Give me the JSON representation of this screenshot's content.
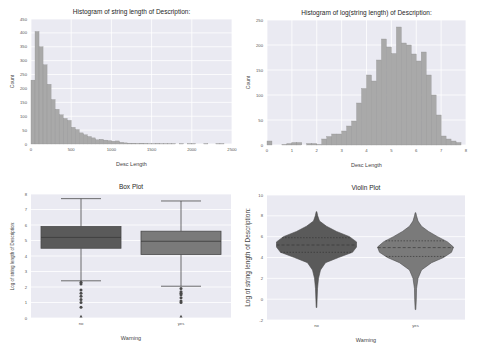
{
  "chart_data": [
    {
      "type": "bar",
      "title": "Histogram of string length of Description:",
      "xlabel": "Desc Length",
      "ylabel": "Count",
      "xlim": [
        0,
        2500
      ],
      "ylim": [
        0,
        450
      ],
      "xticks": [
        "0",
        "500",
        "1000",
        "1500",
        "2000",
        "2500"
      ],
      "yticks": [
        "0",
        "50",
        "100",
        "150",
        "200",
        "250",
        "300",
        "350",
        "400",
        "450"
      ],
      "grid": true,
      "bin_width": 50,
      "bin_starts": [
        0,
        50,
        100,
        150,
        200,
        250,
        300,
        350,
        400,
        450,
        500,
        550,
        600,
        650,
        700,
        750,
        800,
        850,
        900,
        950,
        1000,
        1050,
        1100,
        1150,
        1200,
        1250,
        1300,
        1350,
        1400,
        1450,
        1500,
        1550,
        1600,
        1650,
        1700,
        1750,
        1800,
        1850,
        1900,
        1950,
        2000,
        2050,
        2100,
        2150,
        2200,
        2250,
        2300,
        2350
      ],
      "values": [
        230,
        405,
        350,
        285,
        215,
        160,
        125,
        105,
        92,
        85,
        60,
        52,
        40,
        33,
        27,
        22,
        15,
        17,
        14,
        12,
        10,
        11,
        6,
        4,
        3,
        3,
        2,
        3,
        2,
        1,
        1,
        2,
        1,
        1,
        1,
        1,
        0,
        1,
        0,
        1,
        1,
        0,
        0,
        1,
        0,
        0,
        1,
        1
      ]
    },
    {
      "type": "bar",
      "title": "Histogram of log(string length) of Description:",
      "xlabel": "Desc Length",
      "ylabel": "Count",
      "xlim": [
        0,
        8
      ],
      "ylim": [
        0,
        250
      ],
      "xticks": [
        "0",
        "1",
        "2",
        "3",
        "4",
        "5",
        "6",
        "7",
        "8"
      ],
      "yticks": [
        "0",
        "50",
        "100",
        "150",
        "200",
        "250"
      ],
      "grid": true,
      "bin_width": 0.2,
      "bin_starts": [
        0.0,
        0.2,
        0.4,
        0.6,
        0.8,
        1.0,
        1.2,
        1.4,
        1.6,
        1.8,
        2.0,
        2.2,
        2.4,
        2.6,
        2.8,
        3.0,
        3.2,
        3.4,
        3.6,
        3.8,
        4.0,
        4.2,
        4.4,
        4.6,
        4.8,
        5.0,
        5.2,
        5.4,
        5.6,
        5.8,
        6.0,
        6.2,
        6.4,
        6.6,
        6.8,
        7.0,
        7.2,
        7.4,
        7.6
      ],
      "values": [
        8,
        0,
        0,
        1,
        3,
        5,
        5,
        0,
        3,
        3,
        1,
        12,
        17,
        22,
        22,
        28,
        38,
        48,
        84,
        113,
        140,
        128,
        170,
        212,
        196,
        183,
        236,
        204,
        200,
        182,
        168,
        186,
        140,
        100,
        60,
        18,
        12,
        8,
        5
      ]
    },
    {
      "type": "box",
      "title": "Box Plot",
      "xlabel": "Warning",
      "ylabel": "Log of string length of Description:",
      "ylim": [
        0,
        8
      ],
      "yticks": [
        "0",
        "1",
        "2",
        "3",
        "4",
        "5",
        "6",
        "7",
        "8"
      ],
      "categories": [
        "no",
        "yes"
      ],
      "series": [
        {
          "name": "no",
          "whisker_low": 2.4,
          "q1": 4.5,
          "median": 5.2,
          "q3": 5.9,
          "whisker_high": 7.7,
          "outliers": [
            2.3,
            2.2,
            1.8,
            1.6,
            1.4,
            1.2,
            1.0,
            0.7,
            0.0
          ],
          "color": "#5a5a5a"
        },
        {
          "name": "yes",
          "whisker_low": 2.05,
          "q1": 4.1,
          "median": 4.95,
          "q3": 5.6,
          "whisker_high": 7.55,
          "outliers": [
            1.9,
            1.7,
            1.6,
            1.5,
            1.3,
            1.1,
            1.0,
            0.0
          ],
          "color": "#7a7a7a"
        }
      ]
    },
    {
      "type": "violin",
      "title": "Violin Plot",
      "xlabel": "Warning",
      "ylabel": "Log of string length of Description:",
      "ylim": [
        -2,
        10
      ],
      "yticks": [
        "-2",
        "0",
        "2",
        "4",
        "6",
        "8",
        "10"
      ],
      "categories": [
        "no",
        "yes"
      ],
      "series": [
        {
          "name": "no",
          "min": -0.8,
          "max": 8.4,
          "median": 5.2,
          "q1": 4.5,
          "q3": 5.9,
          "color": "#5a5a5a"
        },
        {
          "name": "yes",
          "min": -1.0,
          "max": 8.3,
          "median": 4.95,
          "q1": 4.1,
          "q3": 5.6,
          "color": "#7a7a7a"
        }
      ]
    }
  ]
}
